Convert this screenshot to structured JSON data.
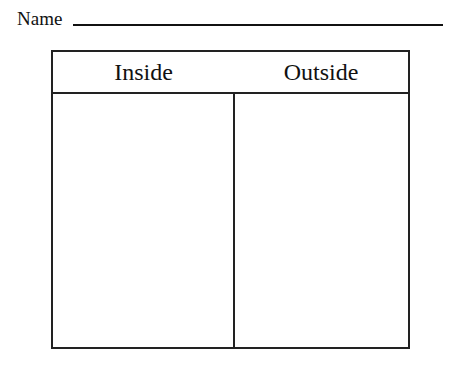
{
  "worksheet": {
    "name_label": "Name",
    "table": {
      "headers": [
        "Inside",
        "Outside"
      ],
      "columns": [
        {
          "label": "Inside",
          "content": ""
        },
        {
          "label": "Outside",
          "content": ""
        }
      ]
    }
  }
}
